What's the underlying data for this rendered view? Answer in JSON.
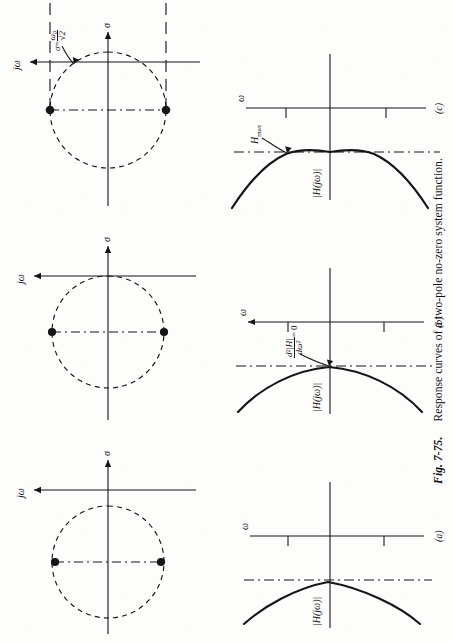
{
  "figure": {
    "number": "Fig. 7-75.",
    "caption": "Response curves of a two-pole no-zero system function.",
    "domain_note": "pole-zero plots and magnitude responses"
  },
  "axes": {
    "sigma_label": "σ",
    "jomega_label": "jω",
    "omega_label": "ω",
    "magnitude_label": "|H(jω)|"
  },
  "panels": [
    {
      "id": "a",
      "sublabel": "(a)",
      "pole_plot": {
        "circle_style": "dashed",
        "poles": [
          {
            "sigma": -0.92,
            "omega": 0.72
          },
          {
            "sigma": -0.92,
            "omega": -0.72
          }
        ],
        "damping_note": "heavily damped, poles far left of jω axis"
      },
      "response": {
        "shape": "monotonic-lowpass",
        "annotations": []
      }
    },
    {
      "id": "b",
      "sublabel": "(b)",
      "pole_plot": {
        "circle_style": "dashed",
        "poles": [
          {
            "sigma": -0.55,
            "omega": 0.84
          },
          {
            "sigma": -0.55,
            "omega": -0.84
          }
        ],
        "damping_note": "maximally flat, second derivative zero"
      },
      "response": {
        "shape": "maximally-flat",
        "annotations": [
          {
            "name": "second-derivative",
            "numerator": "d²|H|",
            "denominator": "dω²",
            "equals": "= 0"
          }
        ]
      }
    },
    {
      "id": "c",
      "sublabel": "(c)",
      "pole_plot": {
        "circle_style": "dashed",
        "poles": [
          {
            "sigma": -0.3,
            "omega": 0.95
          },
          {
            "sigma": -0.3,
            "omega": -0.95
          }
        ],
        "sigma_annotation": {
          "symbol": "σ",
          "equals": "=",
          "value_num": "ω₀",
          "value_den": "√2"
        },
        "damping_note": "lightly damped, peaking response"
      },
      "response": {
        "shape": "peaking",
        "annotations": [
          {
            "name": "peak-magnitude",
            "text": "H",
            "subscript": "max"
          }
        ],
        "projection_lines": "dashed horizontal lines linking pole ω to response peak"
      }
    }
  ],
  "colors": {
    "ink": "#151515",
    "paper": "#fdfdfc",
    "dash": "#1a1a1a"
  }
}
